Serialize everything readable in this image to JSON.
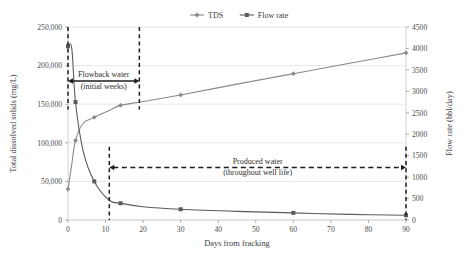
{
  "chart_data": {
    "type": "line",
    "title": "",
    "xlabel": "Days from fracking",
    "ylabel": "Total dissolved solids (mg/L)",
    "y2label": "Flow rate (bbl/day)",
    "xlim": [
      0,
      90
    ],
    "ylim": [
      0,
      250000
    ],
    "y2lim": [
      0,
      4500
    ],
    "grid": true,
    "legend_position": "top",
    "x_ticks": [
      "0",
      "10",
      "20",
      "30",
      "40",
      "50",
      "60",
      "70",
      "80",
      "90"
    ],
    "x_tick_values": [
      0,
      10,
      20,
      30,
      40,
      50,
      60,
      70,
      80,
      90
    ],
    "y_ticks": [
      "0",
      "50,000",
      "100,000",
      "150,000",
      "200,000",
      "250,000"
    ],
    "y_tick_values": [
      0,
      50000,
      100000,
      150000,
      200000,
      250000
    ],
    "y2_ticks": [
      "0",
      "500",
      "1000",
      "1500",
      "2000",
      "2500",
      "3000",
      "3500",
      "4000",
      "4500"
    ],
    "y2_tick_values": [
      0,
      500,
      1000,
      1500,
      2000,
      2500,
      3000,
      3500,
      4000,
      4500
    ],
    "series": [
      {
        "name": "TDS",
        "axis": "left",
        "marker": "diamond",
        "color": "#8a8a8a",
        "x": [
          0,
          1,
          2,
          4,
          7,
          11,
          14,
          20,
          30,
          45,
          60,
          75,
          90
        ],
        "values": [
          40000,
          72000,
          103000,
          125000,
          133000,
          142000,
          148500,
          153500,
          162000,
          176000,
          189500,
          203000,
          216500
        ]
      },
      {
        "name": "Flow rate",
        "axis": "right",
        "marker": "square",
        "color": "#5a5a5a",
        "x": [
          0,
          1,
          2,
          4,
          7,
          11,
          14,
          20,
          30,
          45,
          60,
          75,
          90
        ],
        "values": [
          4050,
          4000,
          2750,
          1620,
          900,
          460,
          390,
          310,
          250,
          200,
          165,
          130,
          110
        ]
      }
    ],
    "legend": [
      {
        "label": "TDS",
        "marker": "diamond",
        "color": "#8a8a8a"
      },
      {
        "label": "Flow rate",
        "marker": "square",
        "color": "#5a5a5a"
      }
    ],
    "annotations": [
      {
        "name": "flowback-water",
        "line1": "Flowback water",
        "line2": "(initial weeks)",
        "x_start": 0,
        "x_end": 19,
        "y_value": 180000,
        "style": "double-arrow-dashed-bounds"
      },
      {
        "name": "produced-water",
        "line1": "Produced water",
        "line2": "(throughout well life)",
        "x_start": 11,
        "x_end": 90,
        "y_value": 68000,
        "style": "double-arrow-dashed-bounds"
      }
    ],
    "vertical_dashed_lines": [
      {
        "x": 0,
        "y_top": 250000,
        "y_bottom": 143000
      },
      {
        "x": 19,
        "y_top": 250000,
        "y_bottom": 143000
      },
      {
        "x": 11,
        "y_top": 95000,
        "y_bottom": 0
      },
      {
        "x": 90,
        "y_top": 95000,
        "y_bottom": 0
      }
    ]
  }
}
